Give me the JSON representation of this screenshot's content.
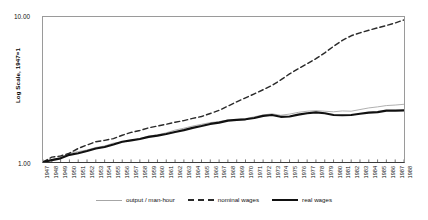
{
  "axes": {
    "ylabel": "Log Scale, 1947=1",
    "ytick_top": "10.00",
    "ytick_bottom": "1.00"
  },
  "legend": {
    "items": [
      {
        "label": "output / man-hour",
        "style": "thin-solid-gray",
        "color": "#a6a6a6"
      },
      {
        "label": "nominal wages",
        "style": "dashed",
        "color": "#2a2a2a"
      },
      {
        "label": "real wages",
        "style": "thick-solid-black",
        "color": "#111111"
      }
    ]
  },
  "chart_data": {
    "type": "line",
    "title": "",
    "xlabel": "",
    "ylabel": "Log Scale, 1947=1",
    "yscale": "log",
    "ylim": [
      1.0,
      10.0
    ],
    "yticks": [
      1.0,
      10.0
    ],
    "ytick_labels": [
      "1.00",
      "10.00"
    ],
    "grid": false,
    "legend_position": "bottom",
    "x": [
      1947,
      1948,
      1949,
      1950,
      1951,
      1952,
      1953,
      1954,
      1955,
      1956,
      1957,
      1958,
      1959,
      1960,
      1961,
      1962,
      1963,
      1964,
      1965,
      1966,
      1967,
      1968,
      1969,
      1970,
      1971,
      1972,
      1973,
      1974,
      1975,
      1976,
      1977,
      1978,
      1979,
      1980,
      1981,
      1982,
      1983,
      1984,
      1985,
      1986,
      1987,
      1988
    ],
    "series": [
      {
        "name": "output / man-hour",
        "color": "#a6a6a6",
        "style": "thin-solid-gray",
        "values": [
          1.0,
          1.04,
          1.07,
          1.15,
          1.18,
          1.21,
          1.26,
          1.29,
          1.35,
          1.37,
          1.41,
          1.45,
          1.51,
          1.54,
          1.59,
          1.66,
          1.71,
          1.77,
          1.82,
          1.87,
          1.9,
          1.95,
          1.96,
          1.99,
          2.05,
          2.11,
          2.15,
          2.1,
          2.14,
          2.2,
          2.24,
          2.26,
          2.24,
          2.22,
          2.25,
          2.24,
          2.3,
          2.36,
          2.4,
          2.45,
          2.47,
          2.5
        ]
      },
      {
        "name": "nominal wages",
        "color": "#2a2a2a",
        "style": "dashed",
        "values": [
          1.0,
          1.08,
          1.1,
          1.15,
          1.24,
          1.31,
          1.38,
          1.41,
          1.45,
          1.53,
          1.6,
          1.65,
          1.72,
          1.77,
          1.82,
          1.88,
          1.93,
          2.0,
          2.06,
          2.16,
          2.27,
          2.43,
          2.6,
          2.77,
          2.95,
          3.15,
          3.37,
          3.68,
          4.05,
          4.4,
          4.76,
          5.16,
          5.66,
          6.28,
          6.9,
          7.42,
          7.78,
          8.1,
          8.42,
          8.74,
          9.1,
          9.55
        ]
      },
      {
        "name": "real wages",
        "color": "#111111",
        "style": "thick-solid-black",
        "values": [
          1.0,
          1.03,
          1.06,
          1.12,
          1.15,
          1.19,
          1.24,
          1.27,
          1.32,
          1.38,
          1.41,
          1.44,
          1.49,
          1.52,
          1.56,
          1.61,
          1.66,
          1.72,
          1.77,
          1.83,
          1.87,
          1.93,
          1.95,
          1.97,
          2.01,
          2.08,
          2.11,
          2.05,
          2.06,
          2.12,
          2.17,
          2.2,
          2.17,
          2.11,
          2.1,
          2.11,
          2.15,
          2.19,
          2.21,
          2.26,
          2.26,
          2.27
        ]
      }
    ]
  }
}
